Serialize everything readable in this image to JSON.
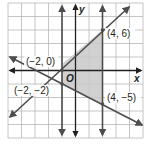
{
  "graph": {
    "x_axis_label": "x",
    "y_axis_label": "y",
    "origin_label": "O",
    "grid": {
      "columns": 10,
      "rows": 10,
      "units_per_square": 2
    },
    "colors": {
      "grid": "#b8b8b8",
      "line": "#4d4d4d",
      "shade": "#c9c9c9",
      "axis": "#231f20"
    },
    "points": [
      {
        "label": "(−2, 0)",
        "x": -2,
        "y": 0
      },
      {
        "label": "(4, 6)",
        "x": 4,
        "y": 6
      },
      {
        "label": "(−2, −2)",
        "x": -2,
        "y": -2
      },
      {
        "label": "(4, −5)",
        "x": 4,
        "y": -5
      }
    ],
    "lines": [
      {
        "name": "rising-line",
        "equation": "y = x + 2"
      },
      {
        "name": "falling-line",
        "equation": "y = -0.5x - 3"
      },
      {
        "name": "vertical-line-left",
        "equation": "x = -1"
      },
      {
        "name": "vertical-line-right",
        "equation": "x = 4"
      }
    ],
    "shaded_region": "bounded by y = x + 2, y = -0.5x - 3, x = -1 (approx.) and x = 4"
  }
}
